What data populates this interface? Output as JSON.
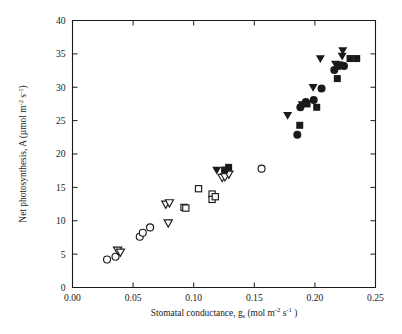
{
  "figure": {
    "background_color": "#ffffff",
    "ink_color": "#1a1a1a"
  },
  "chart_data": {
    "type": "scatter",
    "title": "",
    "xlabel": "Stomatal conductance, g_s (mol m^-2 s^-1)",
    "ylabel": "Net photosynthesis, A (umol m^-2 s^-1)",
    "xlim": [
      0.0,
      0.25
    ],
    "ylim": [
      0,
      40
    ],
    "xticks": [
      0.0,
      0.05,
      0.1,
      0.15,
      0.2,
      0.25
    ],
    "xtick_labels": [
      "0.00",
      "0.05",
      "0.10",
      "0.15",
      "0.20",
      "0.25"
    ],
    "yticks": [
      0,
      5,
      10,
      15,
      20,
      25,
      30,
      35,
      40
    ],
    "ytick_labels": [
      "0",
      "5",
      "10",
      "15",
      "20",
      "25",
      "30",
      "35",
      "40"
    ],
    "grid": false,
    "legend": "none",
    "series": [
      {
        "name": "open-circle",
        "marker": "circle",
        "fill": "open",
        "points": [
          [
            0.0285,
            4.2
          ],
          [
            0.0355,
            4.6
          ],
          [
            0.0555,
            7.6
          ],
          [
            0.058,
            8.2
          ],
          [
            0.064,
            9.0
          ],
          [
            0.156,
            17.8
          ]
        ]
      },
      {
        "name": "open-triangle-down",
        "marker": "triangle-down",
        "fill": "open",
        "points": [
          [
            0.0372,
            5.5
          ],
          [
            0.0395,
            5.2
          ],
          [
            0.077,
            12.4
          ],
          [
            0.08,
            12.6
          ],
          [
            0.079,
            9.6
          ],
          [
            0.1235,
            16.4
          ],
          [
            0.1258,
            16.5
          ],
          [
            0.129,
            16.9
          ]
        ]
      },
      {
        "name": "open-square",
        "marker": "square",
        "fill": "open",
        "points": [
          [
            0.092,
            12.0
          ],
          [
            0.0935,
            11.9
          ],
          [
            0.104,
            14.8
          ],
          [
            0.1152,
            14.0
          ],
          [
            0.1152,
            13.2
          ],
          [
            0.1178,
            13.6
          ]
        ]
      },
      {
        "name": "filled-triangle-down",
        "marker": "triangle-down",
        "fill": "filled",
        "points": [
          [
            0.119,
            17.5
          ],
          [
            0.1775,
            25.7
          ],
          [
            0.1895,
            27.3
          ],
          [
            0.1985,
            29.9
          ],
          [
            0.2045,
            34.2
          ],
          [
            0.217,
            33.4
          ],
          [
            0.223,
            35.4
          ],
          [
            0.2225,
            34.6
          ]
        ]
      },
      {
        "name": "filled-circle",
        "marker": "circle",
        "fill": "filled",
        "points": [
          [
            0.1855,
            22.9
          ],
          [
            0.188,
            27.0
          ],
          [
            0.1925,
            27.8
          ],
          [
            0.199,
            28.1
          ],
          [
            0.2055,
            29.8
          ],
          [
            0.216,
            32.6
          ],
          [
            0.2195,
            33.2
          ],
          [
            0.2215,
            33.3
          ],
          [
            0.224,
            33.2
          ]
        ]
      },
      {
        "name": "filled-square",
        "marker": "square",
        "fill": "filled",
        "points": [
          [
            0.1288,
            18.0
          ],
          [
            0.1255,
            17.6
          ],
          [
            0.1875,
            24.3
          ],
          [
            0.1935,
            27.5
          ],
          [
            0.2015,
            27.0
          ],
          [
            0.2185,
            31.3
          ],
          [
            0.229,
            34.3
          ],
          [
            0.2345,
            34.3
          ]
        ]
      }
    ]
  },
  "axes": {
    "x_title_parts": {
      "main": "Stomatal conductance, g",
      "subscript": "s",
      "unit_open": " (mol m",
      "unit_sup1": "-2",
      "unit_mid": " s",
      "unit_sup2": "-1",
      "unit_close": " )"
    },
    "y_title_parts": {
      "main": "Net photosynthesis, A (µmol m",
      "sup1": "-2",
      "mid": " s",
      "sup2": "-1",
      "close": ")"
    }
  }
}
